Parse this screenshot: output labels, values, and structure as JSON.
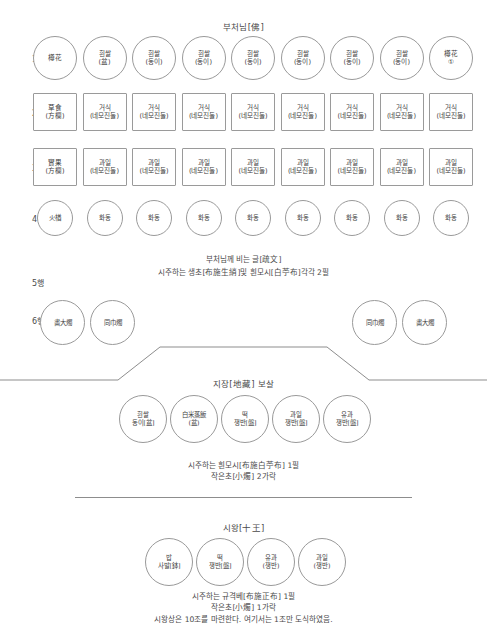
{
  "diagram": {
    "title_top": "부처님[佛]",
    "rows": [
      {
        "label": "1행",
        "shape": "circle",
        "items": [
          {
            "l1": "樽花",
            "l2": ""
          },
          {
            "l1": "흰쌀",
            "l2": "(盆)"
          },
          {
            "l1": "흰쌀",
            "l2": "(동이)"
          },
          {
            "l1": "흰쌀",
            "l2": "(동이)"
          },
          {
            "l1": "흰쌀",
            "l2": "(동이)"
          },
          {
            "l1": "흰쌀",
            "l2": "(동이)"
          },
          {
            "l1": "흰쌀",
            "l2": "(동이)"
          },
          {
            "l1": "흰쌀",
            "l2": "(동이)"
          },
          {
            "l1": "樽花",
            "l2": "①"
          }
        ]
      },
      {
        "label": "2행",
        "shape": "square",
        "items": [
          {
            "l1": "草食",
            "l2": "(方欄)"
          },
          {
            "l1": "거식",
            "l2": "(네모진둘)"
          },
          {
            "l1": "거식",
            "l2": "(네모진둘)"
          },
          {
            "l1": "거식",
            "l2": "(네모진둘)"
          },
          {
            "l1": "거식",
            "l2": "(네모진둘)"
          },
          {
            "l1": "거식",
            "l2": "(네모진둘)"
          },
          {
            "l1": "거식",
            "l2": "(네모진둘)"
          },
          {
            "l1": "거식",
            "l2": "(네모진둘)"
          },
          {
            "l1": "거식",
            "l2": "(네모진둘)"
          }
        ]
      },
      {
        "label": "3행",
        "shape": "square",
        "items": [
          {
            "l1": "實果",
            "l2": "(方欄)"
          },
          {
            "l1": "과일",
            "l2": "(네모진둘)"
          },
          {
            "l1": "과일",
            "l2": "(네모진둘)"
          },
          {
            "l1": "과일",
            "l2": "(네모진둘)"
          },
          {
            "l1": "과일",
            "l2": "(네모진둘)"
          },
          {
            "l1": "과일",
            "l2": "(네모진둘)"
          },
          {
            "l1": "과일",
            "l2": "(네모진둘)"
          },
          {
            "l1": "과일",
            "l2": "(네모진둘)"
          },
          {
            "l1": "과일",
            "l2": "(네모진둘)"
          }
        ]
      },
      {
        "label": "4행",
        "shape": "circle",
        "items": [
          {
            "l1": "火楢",
            "l2": ""
          },
          {
            "l1": "화동",
            "l2": ""
          },
          {
            "l1": "화동",
            "l2": ""
          },
          {
            "l1": "화동",
            "l2": ""
          },
          {
            "l1": "화동",
            "l2": ""
          },
          {
            "l1": "화동",
            "l2": ""
          },
          {
            "l1": "화동",
            "l2": ""
          },
          {
            "l1": "화동",
            "l2": ""
          },
          {
            "l1": "화동",
            "l2": ""
          }
        ]
      }
    ],
    "row5": {
      "label": "5행",
      "line1": "부처님께 비는 글[疏文]",
      "line2": "시주하는 생초[布施生綃]및 흰모시[白苧布]각각 2필"
    },
    "row6": {
      "label": "6행",
      "left": [
        {
          "l1": "畵大燭",
          "l2": ""
        },
        {
          "l1": "同巾燭",
          "l2": ""
        }
      ],
      "right": [
        {
          "l1": "同巾燭",
          "l2": ""
        },
        {
          "l1": "畵大燭",
          "l2": ""
        }
      ]
    },
    "jijang": {
      "title": "지장[地藏] 보살",
      "items": [
        {
          "l1": "흰쌀",
          "l2": "동이[盆]"
        },
        {
          "l1": "白米蒸飯",
          "l2": "(盆)"
        },
        {
          "l1": "떡",
          "l2": "쟁반[盤]"
        },
        {
          "l1": "과일",
          "l2": "쟁반[盤]"
        },
        {
          "l1": "유과",
          "l2": "쟁반[盤]"
        }
      ],
      "note1": "시주하는 흰모시[布施白苧布] 1필",
      "note2": "작은초[小燭] 2가락"
    },
    "siwang": {
      "title": "시왕[十王]",
      "items": [
        {
          "l1": "밥",
          "l2": "사발[鉢]"
        },
        {
          "l1": "떡",
          "l2": "쟁반[盤]"
        },
        {
          "l1": "유과",
          "l2": "(쟁반)"
        },
        {
          "l1": "과일",
          "l2": "(쟁반)"
        }
      ],
      "note1": "시주하는 규격베[布施正布] 1필",
      "note2": "작은초[小燭] 1가락",
      "note3": "시왕상은 10조를 마련한다. 여기서는 1조만 도식하였음."
    }
  }
}
